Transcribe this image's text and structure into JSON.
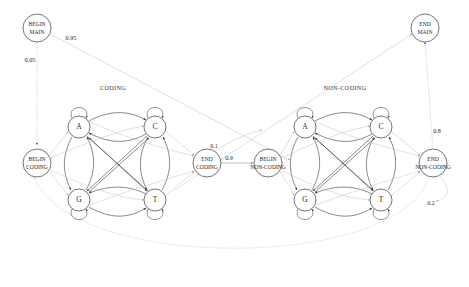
{
  "diagram": {
    "groups": [
      {
        "id": "coding",
        "title": "CODING",
        "x": 113,
        "y": 88
      },
      {
        "id": "noncoding",
        "title": "NON-CODING",
        "x": 345,
        "y": 88
      }
    ],
    "terminal_nodes": [
      {
        "id": "begin-main",
        "line1": "BEGIN",
        "line2": "MAIN",
        "x": 37,
        "y": 28,
        "r": 14
      },
      {
        "id": "end-main",
        "line1": "END",
        "line2": "MAIN",
        "x": 425,
        "y": 28,
        "r": 14
      },
      {
        "id": "begin-coding",
        "line1": "BEGIN",
        "line2": "CODING",
        "x": 37,
        "y": 163,
        "r": 14
      },
      {
        "id": "end-coding",
        "line1": "END",
        "line2": "CODING",
        "x": 207,
        "y": 163,
        "r": 14
      },
      {
        "id": "begin-noncoding",
        "line1": "BEGIN",
        "line2": "NON-CODING",
        "x": 268,
        "y": 163,
        "r": 14
      },
      {
        "id": "end-noncoding",
        "line1": "END",
        "line2": "NON-CODING",
        "x": 433,
        "y": 163,
        "r": 14
      }
    ],
    "base_nodes": [
      {
        "id": "coding-a",
        "label": "A",
        "x": 79,
        "y": 127,
        "r": 11
      },
      {
        "id": "coding-c",
        "label": "C",
        "x": 155,
        "y": 127,
        "r": 11
      },
      {
        "id": "coding-g",
        "label": "G",
        "x": 79,
        "y": 200,
        "r": 11
      },
      {
        "id": "coding-t",
        "label": "T",
        "x": 155,
        "y": 200,
        "r": 11
      },
      {
        "id": "noncoding-a",
        "label": "A",
        "x": 305,
        "y": 127,
        "r": 11
      },
      {
        "id": "noncoding-c",
        "label": "C",
        "x": 381,
        "y": 127,
        "r": 11
      },
      {
        "id": "noncoding-g",
        "label": "G",
        "x": 305,
        "y": 200,
        "r": 11
      },
      {
        "id": "noncoding-t",
        "label": "T",
        "x": 381,
        "y": 200,
        "r": 11
      }
    ],
    "probabilities": [
      {
        "id": "p-begin-main-to-coding-branch",
        "value": "0.95",
        "x": 71,
        "y": 38
      },
      {
        "id": "p-begin-main-to-begin-coding",
        "value": "0.05",
        "x": 30,
        "y": 60
      },
      {
        "id": "p-end-coding-upper",
        "value": "0.1",
        "x": 214,
        "y": 146
      },
      {
        "id": "p-end-coding-to-begin-noncoding",
        "value": "0.9",
        "x": 228,
        "y": 158
      },
      {
        "id": "p-end-noncoding-to-end-main",
        "value": "0.8",
        "x": 435,
        "y": 131
      },
      {
        "id": "p-end-noncoding-loop-back",
        "value": "0.2",
        "x": 430,
        "y": 203
      }
    ]
  }
}
